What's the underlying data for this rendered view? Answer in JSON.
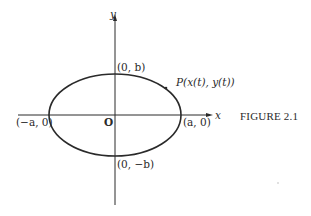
{
  "figure": {
    "caption": "FIGURE 2.1",
    "axes": {
      "x_label": "x",
      "y_label": "y",
      "origin_label": "O"
    },
    "curve": {
      "type": "ellipse",
      "center": [
        0,
        0
      ],
      "semi_axes": [
        "a",
        "b"
      ]
    },
    "points": {
      "top": "(0, b)",
      "bottom": "(0, −b)",
      "left": "(−a, 0)",
      "right": "(a, 0)",
      "moving_point": "P(x(t), y(t))"
    },
    "colors": {
      "background": "#ffffff",
      "ink": "#2a2a2a"
    }
  }
}
